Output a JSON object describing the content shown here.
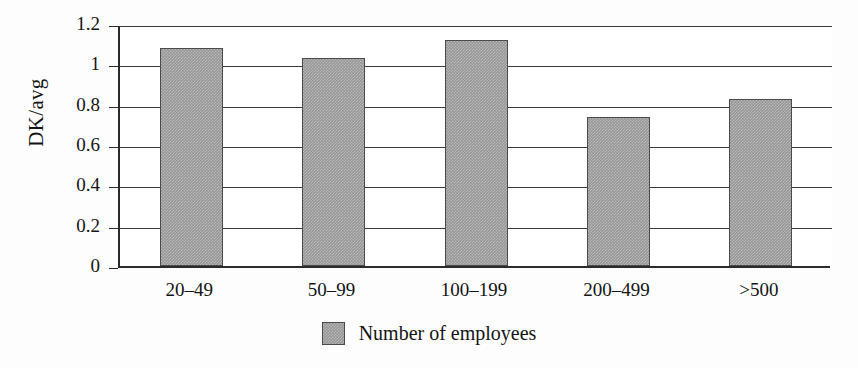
{
  "chart_data": {
    "type": "bar",
    "title": "",
    "subtitle": "",
    "xlabel": "",
    "ylabel": "DK/avg",
    "categories": [
      "20–49",
      "50–99",
      "100–199",
      "200–499",
      ">500"
    ],
    "values": [
      1.08,
      1.03,
      1.12,
      0.74,
      0.83
    ],
    "series": [
      {
        "name": "Number of employees",
        "values": [
          1.08,
          1.03,
          1.12,
          0.74,
          0.83
        ]
      }
    ],
    "ylim": [
      0,
      1.2
    ],
    "ytick_labels": [
      "1.2",
      "1",
      "0.8",
      "0.6",
      "0.4",
      "0.2",
      "0"
    ],
    "ytick_values": [
      1.2,
      1.0,
      0.8,
      0.6,
      0.4,
      0.2,
      0
    ],
    "grid": "horizontal",
    "legend": {
      "position": "bottom-center",
      "entries": [
        {
          "label": "Number of employees",
          "color": "#969696"
        }
      ]
    },
    "colors": {
      "bar_fill": "#969696",
      "bar_border": "#4a4a4a",
      "axis": "#2b2b2b",
      "gridline": "#3a3a3a",
      "text": "#141414",
      "background": "#fdfdfd"
    }
  }
}
